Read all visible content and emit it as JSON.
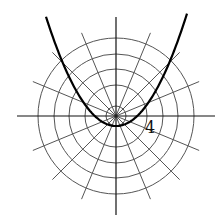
{
  "diagram": {
    "center": [
      116,
      116
    ],
    "circle_radii": [
      10,
      31,
      47,
      62,
      78
    ],
    "ray_angle_step_deg": 22.5,
    "label": "4",
    "colors": {
      "grid": "#555555",
      "axis": "#111111",
      "curve": "#000000"
    }
  }
}
